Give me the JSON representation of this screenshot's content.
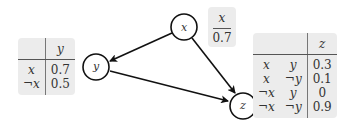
{
  "diagram": {
    "nodes": [
      {
        "id": "x",
        "label": "x"
      },
      {
        "id": "y",
        "label": "y"
      },
      {
        "id": "z",
        "label": "z"
      }
    ],
    "edges": [
      {
        "from": "x",
        "to": "y"
      },
      {
        "from": "x",
        "to": "z"
      },
      {
        "from": "y",
        "to": "z"
      }
    ],
    "cpt_x": {
      "header": "x",
      "value": "0.7"
    },
    "cpt_y": {
      "header": [
        "",
        "y"
      ],
      "rows": [
        {
          "cond": "x",
          "value": "0.7"
        },
        {
          "cond": "¬x",
          "value": "0.5"
        }
      ]
    },
    "cpt_z": {
      "header": [
        "",
        "",
        "z"
      ],
      "rows": [
        {
          "c1": "x",
          "c2": "y",
          "value": "0.3"
        },
        {
          "c1": "x",
          "c2": "¬y",
          "value": "0.1"
        },
        {
          "c1": "¬x",
          "c2": "y",
          "value": "0"
        },
        {
          "c1": "¬x",
          "c2": "¬y",
          "value": "0.9"
        }
      ]
    }
  }
}
